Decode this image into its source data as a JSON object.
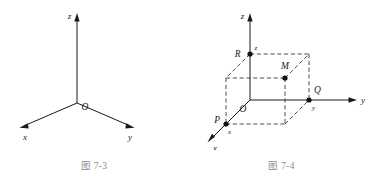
{
  "figure_left": {
    "name": "figure-7-3",
    "caption": "图 7-3",
    "axis_labels": {
      "x": "x",
      "y": "y",
      "z": "z"
    },
    "origin_label": "O",
    "description": "Right-handed 3D Cartesian coordinate system with three axes drawn from origin O: z vertical upward, x toward lower-left, y toward lower-right.",
    "stroke_color": "#1a1a1a"
  },
  "figure_right": {
    "name": "figure-7-4",
    "caption": "图 7-4",
    "axis_labels": {
      "x": "x",
      "y": "y",
      "z": "z"
    },
    "origin_label": "O",
    "points": [
      {
        "label": "M",
        "note": "point in space"
      },
      {
        "label": "P",
        "coord_label": "x",
        "note": "projection on x-axis"
      },
      {
        "label": "Q",
        "coord_label": "y",
        "note": "projection on y-axis"
      },
      {
        "label": "R",
        "coord_label": "z",
        "note": "projection on z-axis"
      }
    ],
    "description": "3D Cartesian coordinate system with a dashed rectangular box (cuboid) showing point M and its projections P on the x-axis, Q on the y-axis and R on the z-axis.",
    "stroke_color": "#1a1a1a",
    "dash_color": "#3a3a3a"
  }
}
